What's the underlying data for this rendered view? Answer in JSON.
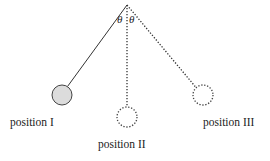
{
  "diagram": {
    "title": "",
    "pivot": {
      "x": 127,
      "y": 5
    },
    "angle_labels": [
      "θ",
      "θ"
    ],
    "positions": [
      {
        "label": "position I",
        "cx": 62,
        "cy": 95,
        "r": 10,
        "style": "solid-filled",
        "fill": "#dcdcdc",
        "string_style": "solid"
      },
      {
        "label": "position II",
        "cx": 127,
        "cy": 117,
        "r": 10,
        "style": "dotted",
        "fill": "none",
        "string_style": "dotted"
      },
      {
        "label": "position III",
        "cx": 203,
        "cy": 95,
        "r": 10,
        "style": "dotted",
        "fill": "none",
        "string_style": "dotted"
      }
    ]
  }
}
